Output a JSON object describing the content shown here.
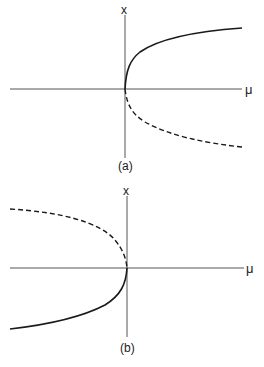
{
  "panels": [
    {
      "id": "a",
      "caption": "(a)",
      "x_axis_label": "μ",
      "y_axis_label": "x",
      "branches": [
        {
          "name": "stable-upper",
          "style": "solid",
          "description": "x = +sqrt(mu), mu >= 0"
        },
        {
          "name": "unstable-lower",
          "style": "dashed",
          "description": "x = -sqrt(mu), mu >= 0"
        }
      ]
    },
    {
      "id": "b",
      "caption": "(b)",
      "x_axis_label": "μ",
      "y_axis_label": "x",
      "branches": [
        {
          "name": "unstable-upper",
          "style": "dashed",
          "description": "x = +sqrt(-mu), mu <= 0"
        },
        {
          "name": "stable-lower",
          "style": "solid",
          "description": "x = -sqrt(-mu), mu <= 0"
        }
      ]
    }
  ],
  "colors": {
    "line": "#1a1a1a",
    "axis": "#555555",
    "background": "#ffffff"
  }
}
